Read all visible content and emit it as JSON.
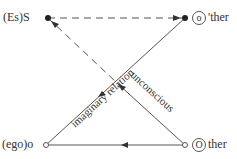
{
  "nodes": {
    "S": {
      "prefix": "(Es)",
      "letter": "S"
    },
    "o_prime": {
      "circled": "o",
      "suffix": "'ther"
    },
    "o": {
      "prefix": "(ego)",
      "letter": "o"
    },
    "O": {
      "circled": "O",
      "suffix": "ther"
    }
  },
  "edges": {
    "imaginary": "imaginary relation",
    "unconscious": "unconscious"
  },
  "colors": {
    "line": "#555555",
    "text": "#333333"
  }
}
